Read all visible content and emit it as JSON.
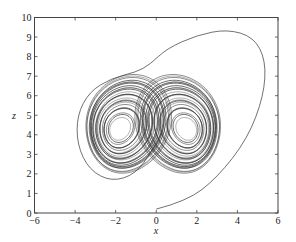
{
  "chart_data": {
    "type": "line",
    "title": "",
    "xlabel": "x",
    "ylabel": "z",
    "xlim": [
      -6,
      6
    ],
    "ylim": [
      0,
      10
    ],
    "xticks": [
      -6,
      -4,
      -2,
      0,
      2,
      4,
      6
    ],
    "yticks": [
      0,
      1,
      2,
      3,
      4,
      5,
      6,
      7,
      8,
      9,
      10
    ],
    "grid": false,
    "legend": null,
    "attractor": {
      "left_lobe_center": [
        -1.8,
        4.3
      ],
      "right_lobe_center": [
        1.5,
        4.3
      ],
      "lobe_x_radius_range": [
        0.6,
        2.4
      ],
      "lobe_z_radius_range": [
        0.6,
        2.6
      ],
      "crossing_point": [
        0.0,
        4.2
      ]
    },
    "transient": {
      "points": [
        [
          0.0,
          0.2
        ],
        [
          1.5,
          0.6
        ],
        [
          3.0,
          1.8
        ],
        [
          4.5,
          3.8
        ],
        [
          5.3,
          6.0
        ],
        [
          5.4,
          7.8
        ],
        [
          4.8,
          9.0
        ],
        [
          3.5,
          9.4
        ],
        [
          2.0,
          9.1
        ],
        [
          0.5,
          8.4
        ],
        [
          -0.3,
          7.6
        ],
        [
          -1.0,
          7.2
        ],
        [
          -2.2,
          6.9
        ],
        [
          -3.3,
          6.2
        ],
        [
          -3.9,
          5.0
        ],
        [
          -3.9,
          3.5
        ],
        [
          -3.3,
          2.2
        ],
        [
          -2.2,
          1.6
        ],
        [
          -1.0,
          2.0
        ],
        [
          -0.2,
          3.2
        ],
        [
          0.3,
          4.2
        ]
      ]
    },
    "line_color": "#333333"
  }
}
